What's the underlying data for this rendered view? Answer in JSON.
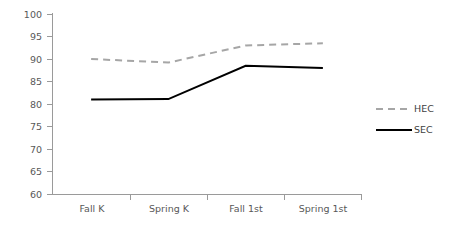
{
  "chart_data": {
    "type": "line",
    "title": "",
    "subtitle": "",
    "xlabel": "",
    "ylabel": "",
    "categories": [
      "Fall K",
      "Spring K",
      "Fall 1st",
      "Spring 1st"
    ],
    "series": [
      {
        "name": "HEC",
        "values": [
          90,
          89.2,
          93,
          93.5
        ],
        "color": "#a6a6a6",
        "style": "dashed",
        "width": 2
      },
      {
        "name": "SEC",
        "values": [
          81,
          81.1,
          88.5,
          88
        ],
        "color": "#000000",
        "style": "solid",
        "width": 2
      }
    ],
    "ylim": [
      60,
      100
    ],
    "yticks": [
      60,
      65,
      70,
      75,
      80,
      85,
      90,
      95,
      100
    ],
    "ytick_labels": [
      "60",
      "65",
      "70",
      "75",
      "80",
      "85",
      "90",
      "95",
      "100"
    ],
    "grid": false,
    "legend_position": "right",
    "axis_color": "#9a9a9a",
    "background": "#ffffff"
  },
  "legend": {
    "entries": [
      {
        "label": "HEC",
        "swatch": "hec-dashed-line-swatch"
      },
      {
        "label": "SEC",
        "swatch": "sec-solid-line-swatch"
      }
    ]
  },
  "axes": {
    "y_axis_name": "y-axis",
    "x_axis_name": "x-axis"
  }
}
